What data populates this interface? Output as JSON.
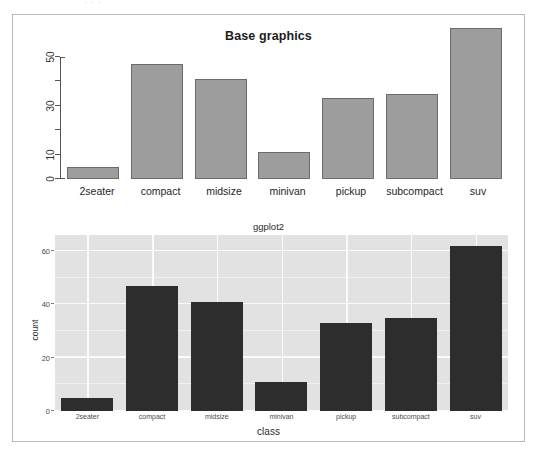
{
  "scan": {
    "top_fragment_text": "· ·          ·"
  },
  "chart_data": [
    {
      "id": "base-graphics",
      "type": "bar",
      "title": "Base graphics",
      "xlabel": "",
      "ylabel": "",
      "categories": [
        "2seater",
        "compact",
        "midsize",
        "minivan",
        "pickup",
        "subcompact",
        "suv"
      ],
      "values": [
        5,
        47,
        41,
        11,
        33,
        35,
        62
      ],
      "ylim": [
        0,
        62
      ],
      "yticks": [
        0,
        10,
        20,
        30,
        40,
        50
      ],
      "ytick_labels": [
        "0",
        "10",
        "",
        "30",
        "",
        "50"
      ],
      "grid": false,
      "legend": "none",
      "bar_fill": "#9d9d9d",
      "bar_border": "#6b6b6b",
      "panel_background": "#ffffff"
    },
    {
      "id": "ggplot2",
      "type": "bar",
      "title": "ggplot2",
      "xlabel": "class",
      "ylabel": "count",
      "categories": [
        "2seater",
        "compact",
        "midsize",
        "minivan",
        "pickup",
        "subcompact",
        "suv"
      ],
      "values": [
        5,
        47,
        41,
        11,
        33,
        35,
        62
      ],
      "ylim": [
        0,
        66
      ],
      "yticks": [
        0,
        20,
        40,
        60
      ],
      "ytick_labels": [
        "0",
        "20",
        "40",
        "60"
      ],
      "minor_yticks": [
        10,
        30,
        50
      ],
      "grid": true,
      "legend": "none",
      "bar_fill": "#2d2d2d",
      "panel_background": "#e2e2e2",
      "grid_color": "#fbfbfb"
    }
  ],
  "colors": {
    "frame_border": "#b9b9b9",
    "page_background": "#ffffff",
    "base_bar": "#9d9d9d",
    "gg_bar": "#2d2d2d",
    "gg_panel": "#e2e2e2"
  }
}
